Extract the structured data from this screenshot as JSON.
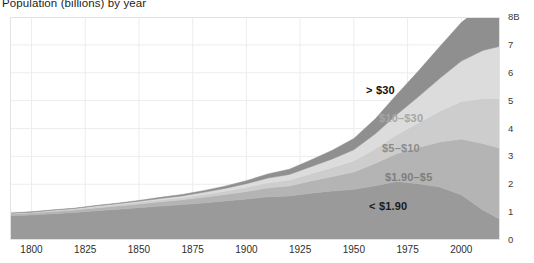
{
  "chart_data": {
    "type": "area",
    "title": "Population (billions) by year",
    "xlabel": "",
    "ylabel": "",
    "stacked": true,
    "grid": true,
    "legend_position": "in-chart-labels",
    "xlim": [
      1790,
      2018
    ],
    "ylim": [
      0,
      8
    ],
    "x_ticks": [
      "1800",
      "1825",
      "1850",
      "1875",
      "1900",
      "1925",
      "1950",
      "1975",
      "2000"
    ],
    "x_tick_values": [
      1800,
      1825,
      1850,
      1875,
      1900,
      1925,
      1950,
      1975,
      2000
    ],
    "y_ticks": [
      "0",
      "1",
      "2",
      "3",
      "4",
      "5",
      "6",
      "7",
      "8B"
    ],
    "y_tick_values": [
      0,
      1,
      2,
      3,
      4,
      5,
      6,
      7,
      8
    ],
    "y_unit": "B",
    "x": [
      1790,
      1800,
      1810,
      1820,
      1830,
      1840,
      1850,
      1860,
      1870,
      1880,
      1890,
      1900,
      1910,
      1920,
      1930,
      1940,
      1950,
      1960,
      1970,
      1980,
      1990,
      2000,
      2010,
      2018
    ],
    "series": [
      {
        "name": "< $1.90",
        "label": "< $1.90",
        "color": "#9a9a9a",
        "label_color": "#1a1a1a",
        "values": [
          0.87,
          0.9,
          0.94,
          0.99,
          1.05,
          1.1,
          1.16,
          1.22,
          1.27,
          1.33,
          1.4,
          1.47,
          1.55,
          1.58,
          1.68,
          1.76,
          1.82,
          1.95,
          2.1,
          2.02,
          1.9,
          1.62,
          1.08,
          0.74
        ]
      },
      {
        "name": "$1.90-$5",
        "label": "$1.90–$5",
        "color": "#b4b4b4",
        "label_color": "#6d6d6d",
        "values": [
          0.06,
          0.07,
          0.08,
          0.09,
          0.1,
          0.12,
          0.13,
          0.15,
          0.17,
          0.2,
          0.23,
          0.27,
          0.32,
          0.36,
          0.44,
          0.52,
          0.62,
          0.8,
          1.0,
          1.3,
          1.62,
          2.0,
          2.38,
          2.55
        ]
      },
      {
        "name": "$5-$10",
        "label": "$5–$10",
        "color": "#cdcdcd",
        "label_color": "#8c8c8c",
        "values": [
          0.02,
          0.02,
          0.03,
          0.03,
          0.04,
          0.05,
          0.06,
          0.07,
          0.08,
          0.1,
          0.12,
          0.15,
          0.18,
          0.21,
          0.26,
          0.32,
          0.4,
          0.52,
          0.68,
          0.88,
          1.1,
          1.35,
          1.62,
          1.78
        ]
      },
      {
        "name": "$10-$30",
        "label": "$10–$30",
        "color": "#dcdcdc",
        "label_color": "#a6a6a6",
        "values": [
          0.01,
          0.01,
          0.02,
          0.02,
          0.03,
          0.03,
          0.04,
          0.05,
          0.06,
          0.08,
          0.1,
          0.13,
          0.17,
          0.2,
          0.25,
          0.31,
          0.4,
          0.54,
          0.72,
          0.94,
          1.18,
          1.45,
          1.72,
          1.88
        ]
      },
      {
        "name": "> $30",
        "label": "> $30",
        "color": "#8f8f8f",
        "label_color": "#111111",
        "values": [
          0.0,
          0.01,
          0.01,
          0.01,
          0.02,
          0.02,
          0.03,
          0.04,
          0.05,
          0.06,
          0.08,
          0.11,
          0.15,
          0.19,
          0.24,
          0.31,
          0.4,
          0.54,
          0.72,
          0.92,
          1.14,
          1.38,
          1.62,
          1.78
        ]
      }
    ],
    "annotations": [
      {
        "text": "> $30",
        "x_px": 366,
        "y_px": 84,
        "color": "#111111"
      },
      {
        "text": "$10–$30",
        "x_px": 379,
        "y_px": 112,
        "color": "#a6a6a6"
      },
      {
        "text": "$5–$10",
        "x_px": 382,
        "y_px": 142,
        "color": "#8c8c8c"
      },
      {
        "text": "$1.90–$5",
        "x_px": 385,
        "y_px": 171,
        "color": "#7e7e7e"
      },
      {
        "text": "< $1.90",
        "x_px": 369,
        "y_px": 200,
        "color": "#1a1a1a"
      }
    ]
  },
  "styling": {
    "background": "#ffffff",
    "grid_color": "#ededed",
    "frame_color": "#e3e3e3",
    "tick_label_color": "#2e2e2e"
  }
}
